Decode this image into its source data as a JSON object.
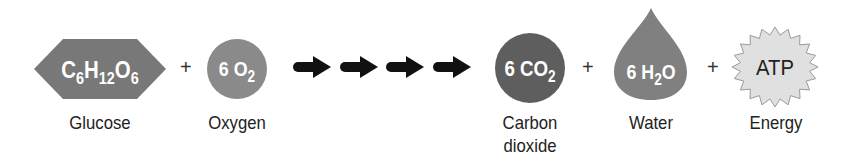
{
  "equation": {
    "reactants": [
      {
        "id": "glucose",
        "formula_parts": [
          [
            "C",
            ""
          ],
          [
            "6",
            "sub"
          ],
          [
            "H",
            ""
          ],
          [
            "12",
            "sub"
          ],
          [
            "O",
            ""
          ],
          [
            "6",
            "sub"
          ]
        ],
        "label": "Glucose",
        "shape": "hexagon",
        "color": "#787878"
      },
      {
        "id": "oxygen",
        "formula_parts": [
          [
            "6 O",
            ""
          ],
          [
            "2",
            "sub"
          ]
        ],
        "label": "Oxygen",
        "shape": "circle",
        "color": "#8a8a8a"
      }
    ],
    "arrows": {
      "count": 4,
      "color": "#111111"
    },
    "products": [
      {
        "id": "carbon-dioxide",
        "formula_parts": [
          [
            "6 CO",
            ""
          ],
          [
            "2",
            "sub"
          ]
        ],
        "label_line1": "Carbon",
        "label_line2": "dioxide",
        "shape": "circle",
        "color": "#5e5e5e"
      },
      {
        "id": "water",
        "formula_parts": [
          [
            "6 H",
            ""
          ],
          [
            "2",
            "sub"
          ],
          [
            "O",
            ""
          ]
        ],
        "label": "Water",
        "shape": "drop",
        "color": "#808080"
      },
      {
        "id": "energy",
        "formula_text": "ATP",
        "label": "Energy",
        "shape": "starburst",
        "color": "#e0e0e0"
      }
    ],
    "plus_sign": "+"
  }
}
